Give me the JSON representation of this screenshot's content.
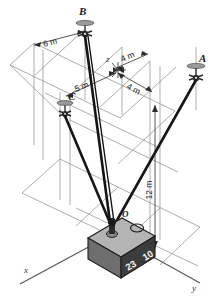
{
  "figure": {
    "background": "#ffffff",
    "line_color": "#7a7a7a",
    "cable_color": "#1a1a1a",
    "axes": {
      "x": {
        "label": "x"
      },
      "y": {
        "label": "y"
      },
      "z": {
        "label": "z"
      }
    },
    "anchors": [
      {
        "id": "A",
        "label": "A"
      },
      {
        "id": "B",
        "label": "B"
      },
      {
        "id": "C",
        "label": "C"
      }
    ],
    "origin": {
      "label": "O"
    },
    "dimensions": [
      {
        "id": "dim-6m",
        "label": "6 m"
      },
      {
        "id": "dim-4m-upper",
        "label": "4 m"
      },
      {
        "id": "dim-5m",
        "label": "5 m"
      },
      {
        "id": "dim-4m-lower",
        "label": "4 m"
      },
      {
        "id": "dim-12m",
        "label": "12 m"
      }
    ],
    "crate": {
      "marking_left": "23",
      "marking_right": "10",
      "top_face_color": "#b4b4b4",
      "front_face_color": "#3c3c3c",
      "side_face_color": "#6e6e6e"
    }
  }
}
